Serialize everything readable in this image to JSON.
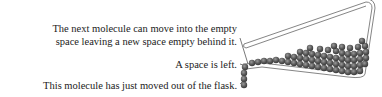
{
  "diagram": {
    "labels": [
      {
        "line1": "The next molecule can move into the empty",
        "line2": "space leaving a new space empty behind it."
      },
      {
        "text": "A space is left."
      },
      {
        "text": "This molecule has just moved out of the flask."
      }
    ],
    "colors": {
      "molecule": "#5a5a5a",
      "flask": "#777777",
      "leader": "#555555",
      "text": "#222222"
    }
  }
}
